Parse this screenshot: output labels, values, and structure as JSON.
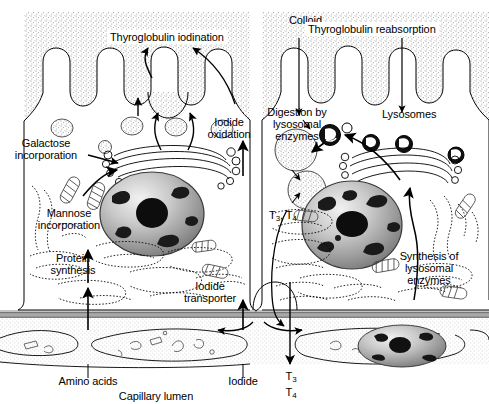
{
  "figure": {
    "compartments": {
      "colloid": "Colloid",
      "capillary": "Capillary lumen"
    },
    "colors": {
      "ink": "#000000",
      "colloid_stipple": "#9a9a9a",
      "basement_membrane": "#9d9d9d",
      "nucleus_rim": "#6e6e6e",
      "chromatin": "#1a1a1a",
      "background": "#ffffff"
    }
  },
  "labels": {
    "colloid": "Colloid",
    "thyroglobulin_iodination": "Thyroglobulin iodination",
    "thyroglobulin_reabsorption": "Thyroglobulin reabsorption",
    "lysosomes": "Lysosomes",
    "digestion_by_lysosomal_enzymes": {
      "line1": "Digestion by",
      "line2": "lysosomal",
      "line3": "enzymes"
    },
    "iodide_oxidation": {
      "line1": "Iodide",
      "line2": "oxidation"
    },
    "galactose_incorporation": {
      "line1": "Galactose",
      "line2": "incorporation"
    },
    "mannose_incorporation": {
      "line1": "Mannose",
      "line2": "incorporation"
    },
    "protein_synthesis": {
      "line1": "Protein",
      "line2": "synthesis"
    },
    "iodide_transporter": {
      "line1": "Iodide",
      "line2": "transporter"
    },
    "synthesis_of_lysosomal_enzymes": {
      "line1": "Synthesis of",
      "line2": "lysosomal",
      "line3": "enzymes"
    },
    "t3_t4_intracellular": "T3, T4",
    "t3_secreted": "T3",
    "t4_secreted": "T4",
    "amino_acids": "Amino acids",
    "iodide": "Iodide",
    "capillary_lumen": "Capillary lumen"
  },
  "organelles": [
    {
      "name": "nucleus-left",
      "kind": "nucleus"
    },
    {
      "name": "nucleus-right",
      "kind": "nucleus"
    },
    {
      "name": "nucleus-endothelial",
      "kind": "nucleus"
    },
    {
      "name": "golgi-left",
      "kind": "golgi-apparatus"
    },
    {
      "name": "golgi-right",
      "kind": "golgi-apparatus"
    },
    {
      "name": "rough-er-left",
      "kind": "rough-endoplasmic-reticulum"
    },
    {
      "name": "rough-er-right",
      "kind": "rough-endoplasmic-reticulum"
    },
    {
      "name": "secretory-vesicles",
      "kind": "vesicle"
    },
    {
      "name": "lysosome-group",
      "kind": "lysosome"
    },
    {
      "name": "colloid-droplet",
      "kind": "endocytic-vesicle"
    },
    {
      "name": "microvilli",
      "kind": "apical-microvilli"
    },
    {
      "name": "basement-membrane",
      "kind": "basal-lamina"
    },
    {
      "name": "capillary-endothelium",
      "kind": "endothelial-cell"
    }
  ]
}
